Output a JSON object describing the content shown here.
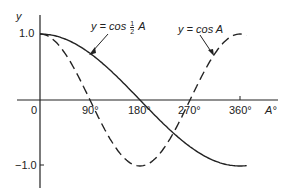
{
  "chart_data": {
    "type": "line",
    "title": "",
    "xlabel": "A°",
    "ylabel": "y",
    "xlim": [
      0,
      370
    ],
    "ylim": [
      -1.3,
      1.2
    ],
    "grid": false,
    "x_ticks": [
      "0",
      "90°",
      "180°",
      "270°",
      "360°"
    ],
    "y_ticks": [
      "1.0",
      "-1.0"
    ],
    "series": [
      {
        "name": "y = cos ½ A",
        "style": "solid",
        "x": [
          0,
          45,
          90,
          135,
          180,
          225,
          270,
          315,
          360
        ],
        "values": [
          1.0,
          0.92,
          0.71,
          0.38,
          0.0,
          -0.38,
          -0.71,
          -0.92,
          -1.0
        ]
      },
      {
        "name": "y = cos A",
        "style": "dashed",
        "x": [
          0,
          45,
          90,
          135,
          180,
          225,
          270,
          315,
          360
        ],
        "values": [
          1.0,
          0.71,
          0.0,
          -0.71,
          -1.0,
          -0.71,
          0.0,
          0.71,
          1.0
        ]
      }
    ],
    "annotations": [
      "y = cos ½ A",
      "y = cos A"
    ]
  },
  "labels": {
    "y_axis": "y",
    "x_axis": "A°",
    "y_one": "1.0",
    "y_neg_one": "−1.0",
    "origin": "0",
    "x90": "90°",
    "x180": "180°",
    "x270": "270°",
    "x360": "360°",
    "half_prefix": "y = cos",
    "half_num": "1",
    "half_den": "2",
    "half_suffix": "A",
    "full_eq": "y = cos A"
  }
}
